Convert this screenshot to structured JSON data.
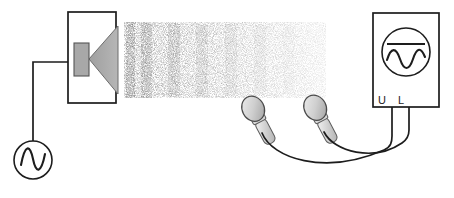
{
  "figure": {
    "kind": "physics-apparatus-diagram",
    "topic": "sound-wave-interference-measurement",
    "background_color": "#ffffff",
    "line_color": "#1d1d1d",
    "fill_gray": "#a8a8a8",
    "fill_gray_light": "#c9c9c9"
  },
  "signal_generator": {
    "name": "signal-generator",
    "symbol": "sine-wave-in-circle",
    "center_x": 33,
    "center_y": 160,
    "radius": 19,
    "lead": {
      "from_y": 141,
      "to_y": 62
    }
  },
  "speaker_enclosure": {
    "name": "loudspeaker-box",
    "x": 68,
    "y": 12,
    "width": 48,
    "height": 91,
    "magnet": {
      "x": 74,
      "y": 43,
      "width": 15,
      "height": 33
    },
    "cone": {
      "apex_x": 89,
      "apex_y": 59,
      "mouth_x": 118,
      "top_y": 26,
      "bottom_y": 94
    }
  },
  "wire_generator_to_speaker": {
    "name": "wire-generator-speaker",
    "points": "33,141 33,62 68,62"
  },
  "wave_field": {
    "name": "sound-wave-field",
    "x": 124,
    "y": 22,
    "width": 202,
    "height": 76,
    "description": "stippled acoustic wavefronts emanating from speaker, fading to the right",
    "band_count": 6,
    "dot_color": "#2a2a2a"
  },
  "microphones": [
    {
      "name": "microphone-left",
      "head_cx": 256,
      "head_cy": 114,
      "tilt_deg": -28,
      "label": ""
    },
    {
      "name": "microphone-right",
      "head_cx": 318,
      "head_cy": 113,
      "tilt_deg": -28,
      "label": ""
    }
  ],
  "oscilloscope": {
    "name": "oscilloscope",
    "x": 373,
    "y": 13,
    "width": 66,
    "height": 94,
    "screen": {
      "cx": 406,
      "cy": 52,
      "r": 24
    },
    "trace_line": "straight-horizontal-line",
    "trace_wave": "sine-wave",
    "terminals": [
      {
        "name": "terminal-u",
        "label": "U",
        "x": 385,
        "y": 101
      },
      {
        "name": "terminal-l",
        "label": "L",
        "x": 400,
        "y": 101
      }
    ]
  },
  "cables": [
    {
      "name": "cable-mic-left-to-u",
      "path": "M 264,131 C 278,152 330,170 392,146 L 392,107"
    },
    {
      "name": "cable-mic-right-to-l",
      "path": "M 326,130 C 340,150 386,158 409,140 L 409,107"
    }
  ]
}
